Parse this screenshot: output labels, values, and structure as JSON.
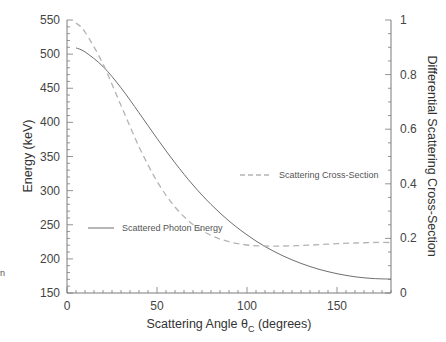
{
  "chart_data": {
    "type": "line",
    "title": "",
    "xlabel": "Scattering Angle θC (degrees)",
    "xlabel_parts": {
      "pre": "Scattering Angle θ",
      "sub": "C",
      "post": " (degrees)"
    },
    "ylabel": "Energy (keV)",
    "y2label": "Differential Scattering Cross-Section",
    "xlim": [
      0,
      180
    ],
    "ylim": [
      150,
      550
    ],
    "y2lim": [
      0,
      1
    ],
    "x_ticks": [
      0,
      50,
      100,
      150
    ],
    "y_ticks": [
      150,
      200,
      250,
      300,
      350,
      400,
      450,
      500,
      550
    ],
    "y2_ticks": [
      0,
      0.2,
      0.4,
      0.6,
      0.8,
      1
    ],
    "y2_tick_labels": [
      "0",
      "0.2",
      "0.4",
      "0.6",
      "0.8",
      "1"
    ],
    "grid": false,
    "x": [
      5,
      10,
      20,
      30,
      40,
      50,
      60,
      70,
      80,
      90,
      100,
      110,
      120,
      130,
      140,
      150,
      160,
      170,
      180
    ],
    "series": [
      {
        "name": "Scattered Photon Energy",
        "axis": "left",
        "style": "solid",
        "color": "#6e6e6e",
        "values": [
          509.1,
          503.3,
          481.9,
          450.6,
          414.1,
          376.5,
          340.7,
          308.2,
          279.8,
          255.5,
          235.1,
          218.2,
          204.4,
          193.4,
          184.7,
          178.3,
          173.8,
          171.2,
          170.3
        ]
      },
      {
        "name": "Scattering Cross-Section",
        "axis": "right",
        "style": "dashed",
        "color": "#b4b4b4",
        "values": [
          0.989,
          0.956,
          0.839,
          0.687,
          0.536,
          0.409,
          0.315,
          0.251,
          0.211,
          0.188,
          0.176,
          0.172,
          0.172,
          0.174,
          0.177,
          0.181,
          0.183,
          0.185,
          0.185
        ]
      }
    ],
    "legend": [
      {
        "label": "Scattered Photon Energy",
        "style": "solid",
        "position": "inside-left-lower"
      },
      {
        "label": "Scattering Cross-Section",
        "style": "dashed",
        "position": "inside-right-middle"
      }
    ],
    "annotations": []
  },
  "fragments": {
    "left_edge_letter": "n"
  }
}
